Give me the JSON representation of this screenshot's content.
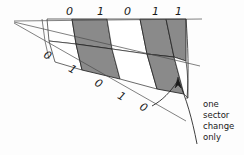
{
  "figure": {
    "background_color": "#fdfdfd",
    "ink_color": "#1a1a1a",
    "sector_fill_gray": "#8a8a8a",
    "sector_fill_white": "#ffffff",
    "apex": {
      "x": 14,
      "y": 22
    }
  },
  "outer_track": {
    "name": "outer-track",
    "labels": [
      "0",
      "1",
      "0",
      "1",
      "1"
    ],
    "label_positions": [
      {
        "x": 66,
        "y": 6
      },
      {
        "x": 96,
        "y": 6
      },
      {
        "x": 124,
        "y": 6
      },
      {
        "x": 152,
        "y": 6
      },
      {
        "x": 176,
        "y": 6
      }
    ],
    "sector_fills": [
      "#ffffff",
      "#8a8a8a",
      "#ffffff",
      "#8a8a8a",
      "#8a8a8a"
    ]
  },
  "inner_track": {
    "name": "inner-track",
    "labels": [
      "0",
      "1",
      "0",
      "1",
      "0"
    ],
    "label_positions": [
      {
        "x": 46,
        "y": 52,
        "rotate": 30
      },
      {
        "x": 70,
        "y": 66,
        "rotate": 30
      },
      {
        "x": 96,
        "y": 80,
        "rotate": 30
      },
      {
        "x": 119,
        "y": 92,
        "rotate": 30
      },
      {
        "x": 141,
        "y": 104,
        "rotate": 30
      }
    ],
    "sector_fills": [
      "#ffffff",
      "#8a8a8a",
      "#ffffff",
      "#8a8a8a",
      "#ffffff"
    ]
  },
  "annotation": {
    "name": "one-sector-change-note",
    "lines": [
      "one",
      "sector",
      "change",
      "only"
    ],
    "text": "one sector change only",
    "x": 202,
    "y": 100,
    "arrow": {
      "tip_x": 178,
      "tip_y": 79,
      "direction": "up-left"
    }
  }
}
